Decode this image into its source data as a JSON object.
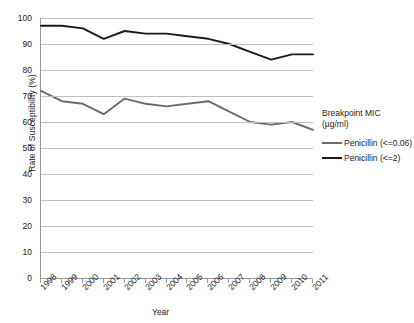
{
  "chart_data": {
    "type": "line",
    "title": "",
    "xlabel": "Year",
    "ylabel": "Rate of Susceptibility (%)",
    "categories": [
      "1998",
      "1999",
      "2000",
      "2001",
      "2002",
      "2003",
      "2004",
      "2005",
      "2006",
      "2007",
      "2008",
      "2009",
      "2010",
      "2011"
    ],
    "ylim": [
      0,
      100
    ],
    "yticks": [
      "0",
      "10",
      "20",
      "30",
      "40",
      "50",
      "60",
      "70",
      "80",
      "90",
      "100"
    ],
    "grid": true,
    "legend_position": "right",
    "legend_title": "Breakpoint MIC (µg/ml)",
    "legend_title_line1": "Breakpoint MIC",
    "legend_title_line2": "(µg/ml)",
    "series": [
      {
        "name": "Penicillin (<=0.06)",
        "color": "#6b6b6b",
        "values": [
          72,
          68,
          67,
          63,
          69,
          67,
          66,
          67,
          68,
          64,
          60,
          59,
          60,
          57
        ]
      },
      {
        "name": "Penicillin (<=2)",
        "color": "#1a1a1a",
        "values": [
          97,
          97,
          96,
          92,
          95,
          94,
          94,
          93,
          92,
          90,
          87,
          84,
          86,
          86
        ]
      }
    ]
  },
  "colors": {
    "gridline": "#bfbfbf",
    "axis": "#9a9a9a",
    "text": "#222222",
    "background": "#ffffff"
  }
}
